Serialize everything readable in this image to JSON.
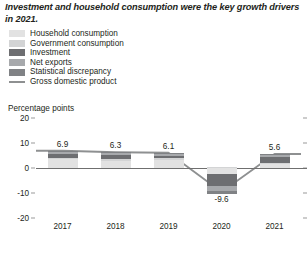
{
  "title": "Investment and household consumption were the key growth drivers in 2021.",
  "legend": {
    "items": [
      {
        "label": "Household consumption",
        "color": "#e2e2e2",
        "type": "swatch",
        "name": "household-consumption"
      },
      {
        "label": "Government consumption",
        "color": "#d3d4d5",
        "type": "swatch",
        "name": "government-consumption"
      },
      {
        "label": "Investment",
        "color": "#6d6e71",
        "type": "swatch",
        "name": "investment"
      },
      {
        "label": "Net exports",
        "color": "#a7a9ac",
        "type": "swatch",
        "name": "net-exports"
      },
      {
        "label": "Statistical discrepancy",
        "color": "#808285",
        "type": "swatch",
        "name": "statistical-discrepancy"
      },
      {
        "label": "Gross domestic product",
        "color": "#8e9091",
        "type": "line",
        "name": "gross-domestic-product"
      }
    ]
  },
  "chart_data": {
    "type": "bar",
    "title": "Investment and household consumption were the key growth drivers in 2021.",
    "xlabel": "",
    "ylabel": "Percentage points",
    "categories": [
      "2017",
      "2018",
      "2019",
      "2020",
      "2021"
    ],
    "ylim": [
      -20,
      20
    ],
    "yticks": [
      "20",
      "10",
      "0",
      "-10",
      "-20"
    ],
    "ytick_values": [
      20,
      10,
      0,
      -10,
      -20
    ],
    "grid": false,
    "legend_position": "top-left",
    "stacked": true,
    "series": [
      {
        "name": "Household consumption",
        "color": "#e2e2e2",
        "values": [
          3.5,
          3.0,
          3.4,
          -2.3,
          1.6
        ]
      },
      {
        "name": "Government consumption",
        "color": "#d3d4d5",
        "values": [
          0.7,
          0.6,
          0.6,
          0.6,
          0.5
        ]
      },
      {
        "name": "Investment",
        "color": "#6d6e71",
        "values": [
          1.6,
          1.5,
          1.0,
          -4.8,
          2.5
        ]
      },
      {
        "name": "Net exports",
        "color": "#a7a9ac",
        "values": [
          0.8,
          0.9,
          0.8,
          -1.9,
          0.7
        ]
      },
      {
        "name": "Statistical discrepancy",
        "color": "#808285",
        "values": [
          0.3,
          0.3,
          0.3,
          -1.2,
          0.3
        ]
      }
    ],
    "line_series": {
      "name": "Gross domestic product",
      "color": "#8e9091",
      "values": [
        6.9,
        6.3,
        6.1,
        -9.6,
        5.6
      ]
    },
    "data_labels": [
      "6.9",
      "6.3",
      "6.1",
      "-9.6",
      "5.6"
    ]
  }
}
